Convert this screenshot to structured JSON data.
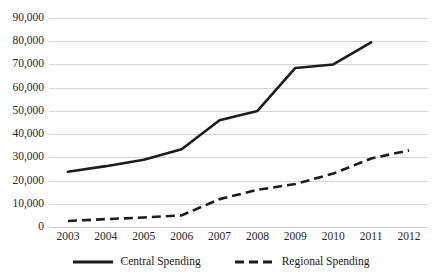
{
  "chart_data": {
    "type": "line",
    "title": "",
    "subtitle": "",
    "xlabel": "",
    "ylabel": "",
    "categories": [
      "2003",
      "2004",
      "2005",
      "2006",
      "2007",
      "2008",
      "2009",
      "2010",
      "2011",
      "2012"
    ],
    "ylim": [
      0,
      90000
    ],
    "ytick_labels": [
      "90,000",
      "80,000",
      "70,000",
      "60,000",
      "50,000",
      "40,000",
      "30,000",
      "20,000",
      "10,000",
      "0"
    ],
    "ytick_values": [
      90000,
      80000,
      70000,
      60000,
      50000,
      40000,
      30000,
      20000,
      10000,
      0
    ],
    "grid": "horizontal",
    "legend_position": "bottom-center",
    "series": [
      {
        "name": "Central Spending",
        "style": "solid",
        "color": "#1c1c1c",
        "x": [
          "2003",
          "2004",
          "2005",
          "2006",
          "2007",
          "2008",
          "2009",
          "2010",
          "2011"
        ],
        "values": [
          23800,
          26200,
          29000,
          33500,
          46000,
          50000,
          68500,
          70000,
          79500
        ]
      },
      {
        "name": "Regional Spending",
        "style": "dashed",
        "color": "#1c1c1c",
        "x": [
          "2003",
          "2004",
          "2005",
          "2006",
          "2007",
          "2008",
          "2009",
          "2010",
          "2011",
          "2012"
        ],
        "values": [
          2600,
          3400,
          4100,
          5000,
          12000,
          16000,
          18500,
          23000,
          29500,
          33000
        ]
      }
    ]
  },
  "legend": {
    "items": [
      {
        "label": "Central Spending",
        "style": "solid"
      },
      {
        "label": "Regional Spending",
        "style": "dashed"
      }
    ]
  }
}
